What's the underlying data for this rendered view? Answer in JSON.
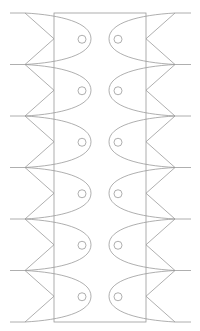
{
  "figure": {
    "width": 200,
    "height": 331,
    "stroke_color": "#9a9a9a",
    "background": "#ffffff",
    "rows": 6,
    "top_y": 13,
    "row_pitch": 51.5,
    "rect": {
      "x": 54,
      "y": 13,
      "width": 92,
      "height": 309
    },
    "left_column": {
      "line_start_x": 10,
      "fin_base_x": 25,
      "fin_apex_x": 54,
      "nose_x": 91,
      "eye_cx": 82,
      "eye_r": 4
    },
    "right_column": {
      "line_end_x": 191,
      "fin_base_x": 175,
      "fin_apex_x": 146,
      "nose_x": 109,
      "eye_cx": 118,
      "eye_r": 4
    }
  }
}
